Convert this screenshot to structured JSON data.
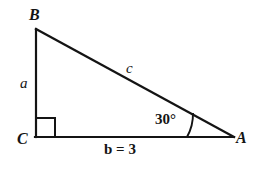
{
  "figure": {
    "kind": "right-triangle-diagram",
    "background_color": "#ffffff",
    "stroke_color": "#141414",
    "vertices": {
      "A": {
        "label": "A",
        "x": 233,
        "y": 137
      },
      "B": {
        "label": "B",
        "x": 36,
        "y": 29
      },
      "C": {
        "label": "C",
        "x": 36,
        "y": 137
      }
    },
    "sides": {
      "a": {
        "label": "a",
        "from": "B",
        "to": "C",
        "description": "vertical leg opposite vertex A"
      },
      "b": {
        "label": "b = 3",
        "value": 3,
        "from": "C",
        "to": "A",
        "description": "horizontal leg opposite vertex B"
      },
      "c": {
        "label": "c",
        "from": "A",
        "to": "B",
        "description": "hypotenuse opposite vertex C"
      }
    },
    "angles": {
      "at_A": {
        "label": "30°",
        "value": 30,
        "unit": "degrees",
        "marker": "arc"
      },
      "at_C": {
        "label": "",
        "value": 90,
        "unit": "degrees",
        "marker": "right-angle-square"
      }
    }
  }
}
